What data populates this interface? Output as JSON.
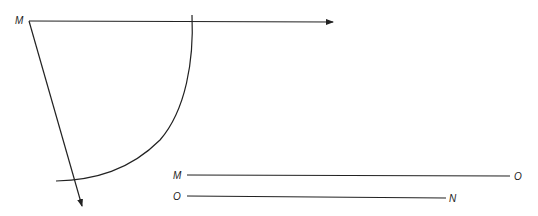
{
  "diagram": {
    "labels": {
      "vertex": "M",
      "segment1_start": "M",
      "segment1_end": "O",
      "segment2_start": "O",
      "segment2_end": "N"
    },
    "colors": {
      "stroke": "#222222",
      "background": "#ffffff"
    },
    "elements": [
      "ray from M pointing right",
      "ray from M pointing down-right",
      "arc centered at M crossing both rays",
      "segment MO",
      "segment ON"
    ]
  }
}
